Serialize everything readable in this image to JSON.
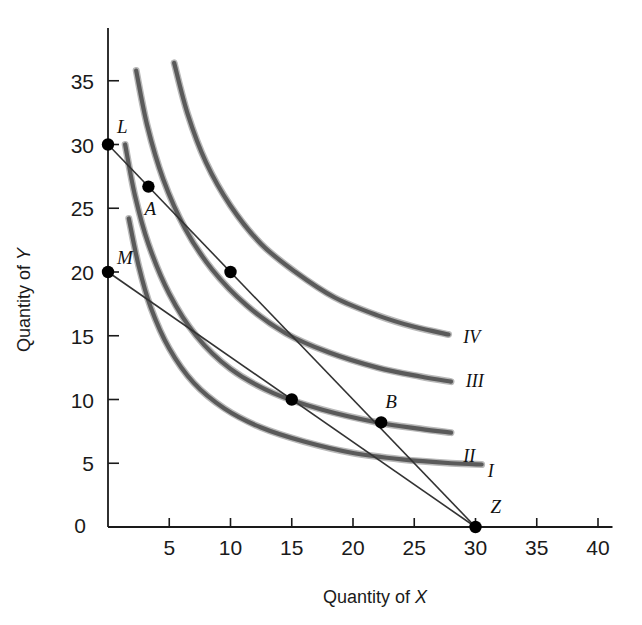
{
  "chart_data": {
    "type": "line",
    "title": "",
    "subtitle": "",
    "xlabel_prefix": "Quantity of ",
    "xlabel_symbol": "X",
    "ylabel_prefix": "Quantity of ",
    "ylabel_symbol": "Y",
    "xlim": [
      0,
      42
    ],
    "ylim": [
      0,
      38
    ],
    "grid": false,
    "legend_position": "inline-right-of-curves",
    "x_ticks": [
      0,
      5,
      10,
      15,
      20,
      25,
      30,
      35,
      40
    ],
    "x_tick_labels": [
      "0",
      "5",
      "10",
      "15",
      "20",
      "25",
      "30",
      "35",
      "40"
    ],
    "y_ticks": [
      0,
      5,
      10,
      15,
      20,
      25,
      30,
      35
    ],
    "y_tick_labels": [
      "0",
      "5",
      "10",
      "15",
      "20",
      "25",
      "30",
      "35"
    ],
    "series": [
      {
        "name": "I",
        "label": "I",
        "kind": "indifference-curve",
        "color": "#5a5a5a",
        "label_point": {
          "x": 31.0,
          "y": 3.9
        },
        "points": [
          {
            "x": 1.7,
            "y": 24.2
          },
          {
            "x": 2.5,
            "y": 20.5
          },
          {
            "x": 3.5,
            "y": 17.2
          },
          {
            "x": 5.0,
            "y": 14.0
          },
          {
            "x": 7.0,
            "y": 11.3
          },
          {
            "x": 9.5,
            "y": 9.3
          },
          {
            "x": 12.5,
            "y": 7.8
          },
          {
            "x": 16.0,
            "y": 6.7
          },
          {
            "x": 20.0,
            "y": 5.8
          },
          {
            "x": 24.0,
            "y": 5.3
          },
          {
            "x": 28.0,
            "y": 5.0
          },
          {
            "x": 30.5,
            "y": 4.9
          }
        ]
      },
      {
        "name": "II",
        "label": "II",
        "kind": "indifference-curve",
        "color": "#5a5a5a",
        "label_point": {
          "x": 29.0,
          "y": 5.1
        },
        "points": [
          {
            "x": 1.4,
            "y": 30.0
          },
          {
            "x": 2.2,
            "y": 26.0
          },
          {
            "x": 3.3,
            "y": 22.2
          },
          {
            "x": 5.0,
            "y": 18.3
          },
          {
            "x": 7.2,
            "y": 15.0
          },
          {
            "x": 10.0,
            "y": 12.4
          },
          {
            "x": 13.5,
            "y": 10.5
          },
          {
            "x": 17.5,
            "y": 9.2
          },
          {
            "x": 22.0,
            "y": 8.2
          },
          {
            "x": 25.5,
            "y": 7.7
          },
          {
            "x": 28.0,
            "y": 7.4
          }
        ]
      },
      {
        "name": "III",
        "label": "III",
        "kind": "indifference-curve",
        "color": "#5a5a5a",
        "label_point": {
          "x": 29.2,
          "y": 11.0
        },
        "points": [
          {
            "x": 2.3,
            "y": 35.8
          },
          {
            "x": 3.2,
            "y": 31.5
          },
          {
            "x": 4.5,
            "y": 27.3
          },
          {
            "x": 6.3,
            "y": 23.4
          },
          {
            "x": 8.5,
            "y": 20.2
          },
          {
            "x": 11.3,
            "y": 17.4
          },
          {
            "x": 14.5,
            "y": 15.2
          },
          {
            "x": 18.0,
            "y": 13.7
          },
          {
            "x": 22.0,
            "y": 12.5
          },
          {
            "x": 25.5,
            "y": 11.8
          },
          {
            "x": 28.0,
            "y": 11.4
          }
        ]
      },
      {
        "name": "IV",
        "label": "IV",
        "kind": "indifference-curve",
        "color": "#5a5a5a",
        "label_point": {
          "x": 29.0,
          "y": 14.4
        },
        "points": [
          {
            "x": 5.4,
            "y": 36.4
          },
          {
            "x": 6.5,
            "y": 32.4
          },
          {
            "x": 8.0,
            "y": 28.6
          },
          {
            "x": 10.0,
            "y": 25.2
          },
          {
            "x": 12.5,
            "y": 22.2
          },
          {
            "x": 15.3,
            "y": 20.0
          },
          {
            "x": 18.5,
            "y": 18.0
          },
          {
            "x": 22.0,
            "y": 16.6
          },
          {
            "x": 25.0,
            "y": 15.7
          },
          {
            "x": 27.8,
            "y": 15.1
          }
        ]
      }
    ],
    "budget_lines": [
      {
        "name": "LZ",
        "from": {
          "x": 0,
          "y": 30
        },
        "to": {
          "x": 30,
          "y": 0
        },
        "color": "#333333"
      },
      {
        "name": "MZ",
        "from": {
          "x": 0,
          "y": 20
        },
        "to": {
          "x": 30,
          "y": 0
        },
        "color": "#333333"
      }
    ],
    "annotated_points": [
      {
        "label": "L",
        "x": 0,
        "y": 30,
        "label_dx": 9,
        "label_dy": -12
      },
      {
        "label": "A",
        "x": 3.3,
        "y": 26.7,
        "label_dx": -4,
        "label_dy": 28
      },
      {
        "label": "M",
        "x": 0,
        "y": 20,
        "label_dx": 9,
        "label_dy": -8
      },
      {
        "label": "",
        "x": 10,
        "y": 20,
        "label_dx": 0,
        "label_dy": 0
      },
      {
        "label": "",
        "x": 15,
        "y": 10,
        "label_dx": 0,
        "label_dy": 0
      },
      {
        "label": "B",
        "x": 22.3,
        "y": 8.2,
        "label_dx": 4,
        "label_dy": -14
      },
      {
        "label": "Z",
        "x": 30,
        "y": 0,
        "label_dx": 15,
        "label_dy": -14
      }
    ]
  },
  "axes": {
    "x_axis_name": "x-axis",
    "y_axis_name": "y-axis"
  }
}
